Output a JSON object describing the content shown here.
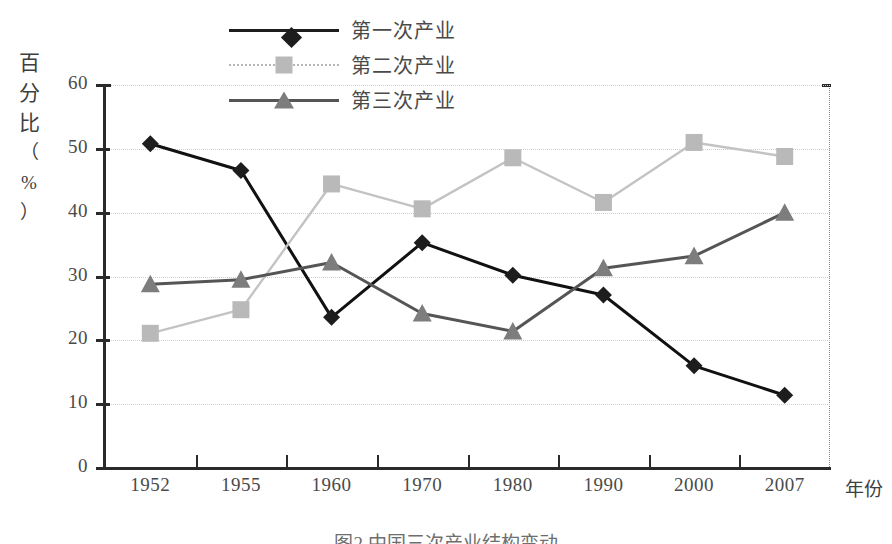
{
  "chart_data": {
    "type": "line",
    "title": "",
    "xlabel": "年份",
    "ylabel": "百分比（%）",
    "ylabel_chars": [
      "百",
      "分",
      "比",
      "（",
      "%",
      "）"
    ],
    "categories": [
      "1952",
      "1955",
      "1960",
      "1970",
      "1980",
      "1990",
      "2000",
      "2007"
    ],
    "ylim": [
      0,
      60
    ],
    "yticks": [
      "0",
      "10",
      "20",
      "30",
      "40",
      "50",
      "60"
    ],
    "grid": true,
    "legend_position": "top-center",
    "series": [
      {
        "name": "第一次产业",
        "marker": "diamond",
        "color": "#1d1d1d",
        "values": [
          50.8,
          46.6,
          23.6,
          35.3,
          30.2,
          27.1,
          16.0,
          11.4
        ]
      },
      {
        "name": "第二次产业",
        "marker": "square",
        "color": "#b9b9b9",
        "values": [
          21.1,
          24.8,
          44.5,
          40.6,
          48.6,
          41.6,
          51.0,
          48.8
        ]
      },
      {
        "name": "第三次产业",
        "marker": "triangle",
        "color": "#7d7d7d",
        "values": [
          28.8,
          29.5,
          32.2,
          24.2,
          21.4,
          31.3,
          33.2,
          40.0
        ]
      }
    ]
  },
  "caption": "图2 中国三次产业结构变动",
  "colors": {
    "axis": "#2a2a2a",
    "grid": "#cfcfcf",
    "text": "#4a4a4a",
    "series1": "#1d1d1d",
    "series2": "#b9b9b9",
    "series3": "#7d7d7d",
    "background": "#ffffff"
  }
}
